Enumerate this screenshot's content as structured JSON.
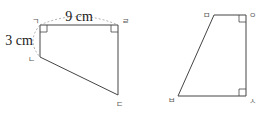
{
  "figure_left": {
    "vertices": {
      "top_left": "ㄱ",
      "bottom_left": "ㄴ",
      "bottom_right": "ㄷ",
      "top_right": "ㄹ"
    },
    "top_length": "9 cm",
    "left_length": "3 cm",
    "right_angles": [
      "ㄱ",
      "ㄹ"
    ]
  },
  "figure_right": {
    "vertices": {
      "top_left": "ㅁ",
      "top_right": "ㅇ",
      "bottom_right": "ㅅ",
      "bottom_left": "ㅂ"
    },
    "right_angles": [
      "ㅇ",
      "ㅅ"
    ]
  },
  "colors": {
    "line": "#444444",
    "dashed": "#999999"
  }
}
